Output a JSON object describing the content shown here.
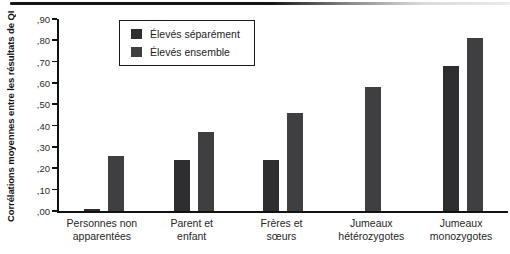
{
  "chart_data": {
    "type": "bar",
    "title": "",
    "xlabel": "",
    "ylabel": "Corrélations moyennes entre les résultats de QI",
    "ylim": [
      0,
      0.9
    ],
    "ytick_step": 0.1,
    "ytick_labels": [
      ",00",
      ",10",
      ",20",
      ",30",
      ",40",
      ",50",
      ",60",
      ",70",
      ",80",
      ",90"
    ],
    "grid": false,
    "legend_position": "top-left-inside",
    "categories": [
      "Personnes non apparentées",
      "Parent et enfant",
      "Frères et sœurs",
      "Jumeaux hétérozygotes",
      "Jumeaux monozygotes"
    ],
    "categories_display": [
      [
        "Personnes non",
        "apparentées"
      ],
      [
        "Parent et",
        "enfant"
      ],
      [
        "Frères et",
        "sœurs"
      ],
      [
        "Jumeaux",
        "hétérozygotes"
      ],
      [
        "Jumeaux",
        "monozygotes"
      ]
    ],
    "series": [
      {
        "name": "Élevés séparément",
        "color": "#2e2e31",
        "values": [
          0.01,
          0.24,
          0.24,
          null,
          0.68
        ]
      },
      {
        "name": "Élevés ensemble",
        "color": "#3f3f42",
        "values": [
          0.26,
          0.37,
          0.46,
          0.58,
          0.81
        ]
      }
    ]
  },
  "colors": {
    "axis": "#111111",
    "background": "#ffffff",
    "top_rule_start": "#141414",
    "top_rule_end": "#ececec"
  }
}
